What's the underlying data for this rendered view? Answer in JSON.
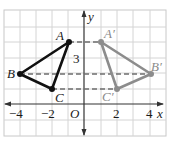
{
  "diagram": {
    "type": "coordinate-plane-reflection",
    "axes": {
      "x_label": "x",
      "y_label": "y",
      "origin_label": "O",
      "x_ticks": [
        {
          "value": -4,
          "label": "−4"
        },
        {
          "value": -2,
          "label": "−2"
        },
        {
          "value": 2,
          "label": "2"
        },
        {
          "value": 4,
          "label": "4"
        }
      ],
      "y_ticks": [
        {
          "value": 3,
          "label": "3"
        }
      ]
    },
    "original_triangle": {
      "color": "#111111",
      "vertices": [
        {
          "name": "A",
          "x": -1,
          "y": 4
        },
        {
          "name": "B",
          "x": -4,
          "y": 2
        },
        {
          "name": "C",
          "x": -2,
          "y": 1
        }
      ]
    },
    "image_triangle": {
      "color": "#8c8c8c",
      "vertices": [
        {
          "name": "A′",
          "x": 1,
          "y": 4
        },
        {
          "name": "B′",
          "x": 4,
          "y": 2
        },
        {
          "name": "C′",
          "x": 2,
          "y": 1
        }
      ]
    },
    "dashed_connectors": [
      {
        "from": "A",
        "to": "A′"
      },
      {
        "from": "B",
        "to": "B′"
      },
      {
        "from": "C",
        "to": "C′"
      }
    ],
    "colors": {
      "grid": "#d4d4d4",
      "axis": "#333333",
      "original": "#111111",
      "image": "#8c8c8c",
      "dashed": "#6e6e6e"
    }
  }
}
